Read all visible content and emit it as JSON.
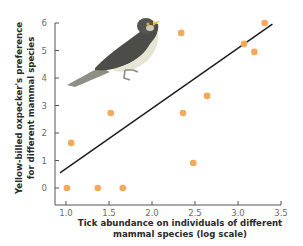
{
  "chart_data": {
    "type": "scatter",
    "title": "",
    "xlabel": [
      "Tick abundance on individuals of different",
      "mammal species (log scale)"
    ],
    "ylabel": [
      "Yellow-billed oxpecker's preference",
      "for different mammal species"
    ],
    "xlim": [
      1.0,
      3.5
    ],
    "ylim": [
      0,
      6
    ],
    "x_ticks": [
      "1.0",
      "1.5",
      "2.0",
      "2.5",
      "3.0",
      "3.5"
    ],
    "y_ticks": [
      "0",
      "1",
      "2",
      "3",
      "4",
      "5",
      "6"
    ],
    "grid": false,
    "legend": null,
    "points": [
      {
        "x": 1.01,
        "y": 0.0
      },
      {
        "x": 1.06,
        "y": 1.64
      },
      {
        "x": 1.37,
        "y": 0.0
      },
      {
        "x": 1.52,
        "y": 2.73
      },
      {
        "x": 1.66,
        "y": 0.0
      },
      {
        "x": 2.34,
        "y": 5.64
      },
      {
        "x": 2.36,
        "y": 2.73
      },
      {
        "x": 2.48,
        "y": 0.91
      },
      {
        "x": 2.64,
        "y": 3.35
      },
      {
        "x": 3.07,
        "y": 5.24
      },
      {
        "x": 3.19,
        "y": 4.95
      },
      {
        "x": 3.31,
        "y": 6.0
      }
    ],
    "trendline": {
      "x0": 0.93,
      "y0": 0.55,
      "x1": 3.4,
      "y1": 5.96
    },
    "annotation": "bird-illustration (yellow-billed oxpecker)",
    "colors": {
      "point": "#F4A95A",
      "trendline": "#1e1e1e",
      "axis": "#555555"
    }
  }
}
